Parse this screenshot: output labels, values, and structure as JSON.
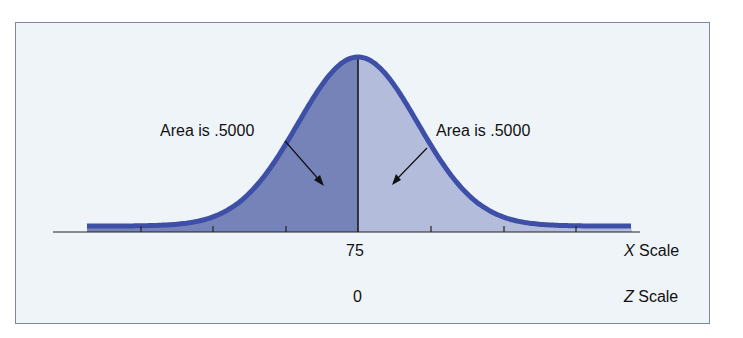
{
  "figure": {
    "left_annotation": "Area is .5000",
    "right_annotation": "Area is .5000",
    "x_value_label": "75",
    "z_value_label": "0",
    "x_scale_label": {
      "var": "X",
      "text": " Scale"
    },
    "z_scale_label": {
      "var": "Z",
      "text": " Scale"
    }
  },
  "colors": {
    "background": "#eff4f9",
    "border": "#7d86a6",
    "curve_stroke": "#3d4fa6",
    "left_fill": "#7683b8",
    "right_fill": "#b4bcdb",
    "axis": "#222222"
  },
  "chart_data": {
    "type": "area",
    "title": "",
    "mean_x": 75,
    "mean_z": 0,
    "regions": [
      {
        "name": "left half",
        "area": 0.5
      },
      {
        "name": "right half",
        "area": 0.5
      }
    ],
    "x_axis_label": "X Scale",
    "z_axis_label": "Z Scale",
    "tick_count": 7,
    "labeled_ticks": {
      "X": [
        "75"
      ],
      "Z": [
        "0"
      ]
    }
  }
}
